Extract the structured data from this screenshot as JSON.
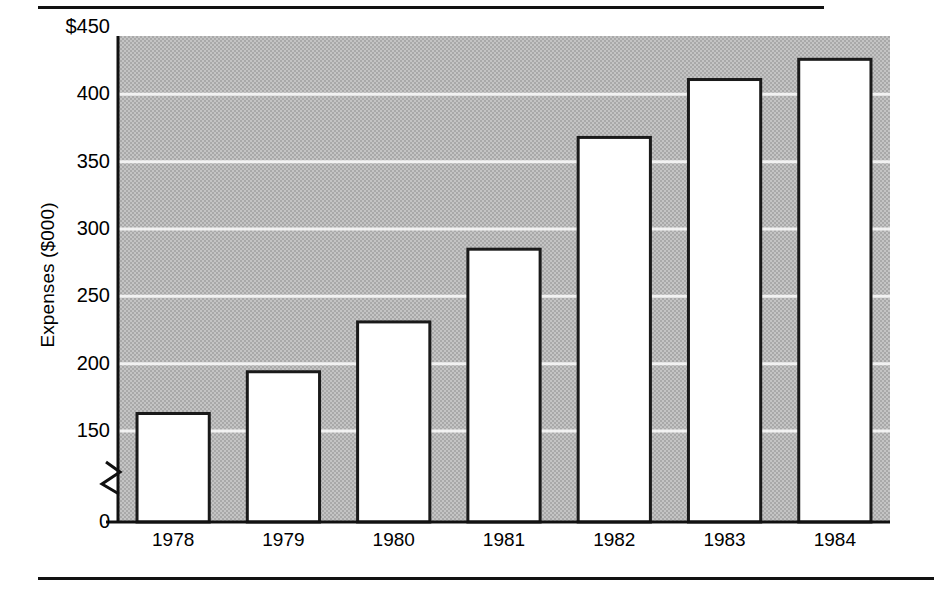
{
  "chart_data": {
    "type": "bar",
    "title": "",
    "subtitle": "",
    "xlabel": "",
    "ylabel": "Expenses ($000)",
    "categories": [
      "1978",
      "1979",
      "1980",
      "1981",
      "1982",
      "1983",
      "1984"
    ],
    "values": [
      163,
      194,
      231,
      285,
      368,
      411,
      426
    ],
    "series": [
      {
        "name": "Expenses",
        "values": [
          163,
          194,
          231,
          285,
          368,
          411,
          426
        ]
      }
    ],
    "ylim": [
      0,
      450
    ],
    "y_ticks": [
      0,
      150,
      200,
      250,
      300,
      350,
      400,
      450
    ],
    "y_tick_labels": [
      "0",
      "150",
      "200",
      "250",
      "300",
      "350",
      "400",
      "$450"
    ],
    "axis_break": {
      "present": true,
      "between": [
        0,
        150
      ],
      "note": "zigzag break on value axis"
    },
    "grid": true,
    "grid_orientation": "horizontal",
    "legend": null,
    "legend_position": "none",
    "annotations": []
  },
  "style": {
    "plot_background": "#b8b8b8",
    "gridline_color": "#f2f2f2",
    "bar_fill": "#ffffff",
    "bar_edge": "#1a1a1a",
    "axis_color": "#111111",
    "text_color": "#000000",
    "page_background": "#ffffff"
  },
  "rules": {
    "top_rule": "horizontal-rule",
    "bottom_rule": "horizontal-rule"
  }
}
